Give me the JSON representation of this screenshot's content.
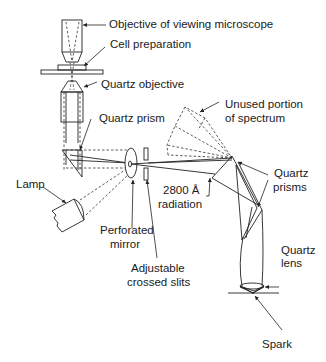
{
  "diagram": {
    "labels": {
      "objective_viewing": "Objective of viewing microscope",
      "cell_preparation": "Cell preparation",
      "quartz_objective": "Quartz objective",
      "quartz_prism": "Quartz prism",
      "unused_line1": "Unused portion",
      "unused_line2": "of spectrum",
      "lamp": "Lamp",
      "radiation_line1": "2800 Å",
      "radiation_line2": "radiation",
      "quartz_prisms_line1": "Quartz",
      "quartz_prisms_line2": "prisms",
      "perforated_line1": "Perforated",
      "perforated_line2": "mirror",
      "slits_line1": "Adjustable",
      "slits_line2": "crossed slits",
      "quartz_lens_line1": "Quartz",
      "quartz_lens_line2": "lens",
      "spark": "Spark"
    },
    "colors": {
      "line": "#222222",
      "text": "#1a1a1a",
      "background": "#ffffff"
    }
  }
}
